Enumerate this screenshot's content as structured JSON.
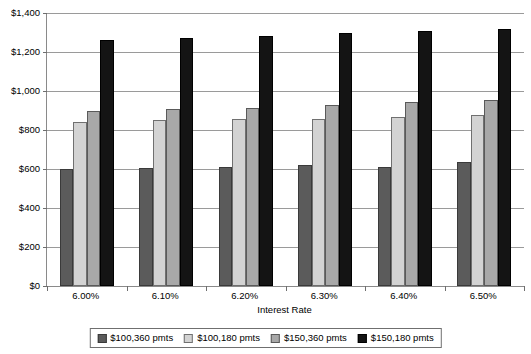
{
  "chart_data": {
    "type": "bar",
    "title": "",
    "xlabel": "Interest Rate",
    "ylabel": "",
    "categories": [
      "6.00%",
      "6.10%",
      "6.20%",
      "6.30%",
      "6.40%",
      "6.50%"
    ],
    "series": [
      {
        "name": "$100,360 pmts",
        "color": "#5b5b5b",
        "values": [
          600,
          604,
          608,
          622,
          610,
          637
        ]
      },
      {
        "name": "$100,180 pmts",
        "color": "#d3d3d3",
        "values": [
          840,
          849,
          855,
          858,
          868,
          878
        ]
      },
      {
        "name": "$150,360 pmts",
        "color": "#a8a8a8",
        "values": [
          896,
          908,
          911,
          929,
          946,
          953
        ]
      },
      {
        "name": "$150,180 pmts",
        "color": "#141414",
        "values": [
          1262,
          1270,
          1281,
          1296,
          1308,
          1316
        ]
      }
    ],
    "ylim": [
      0,
      1400
    ],
    "ytick_values": [
      0,
      200,
      400,
      600,
      800,
      1000,
      1200,
      1400
    ],
    "ytick_labels": [
      "$0",
      "$200",
      "$400",
      "$600",
      "$800",
      "$1,000",
      "$1,200",
      "$1,400"
    ],
    "grid": true,
    "legend_position": "bottom"
  }
}
